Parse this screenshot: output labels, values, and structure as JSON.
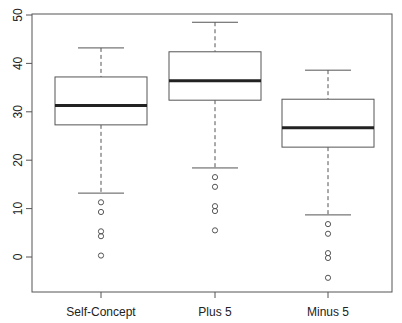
{
  "chart_data": {
    "type": "boxplot",
    "title": "",
    "xlabel": "",
    "ylabel": "",
    "ylim": [
      -6,
      50
    ],
    "yticks": [
      0,
      10,
      20,
      30,
      40,
      50
    ],
    "grid": false,
    "legend": null,
    "categories": [
      "Self-Concept",
      "Plus 5",
      "Minus 5"
    ],
    "series": [
      {
        "name": "Self-Concept",
        "whisker_high": 43.2,
        "q3": 37.2,
        "median": 31.3,
        "q1": 27.3,
        "whisker_low": 13.2,
        "outliers": [
          11.3,
          9.3,
          5.3,
          4.3,
          0.3
        ]
      },
      {
        "name": "Plus 5",
        "whisker_high": 48.5,
        "q3": 42.4,
        "median": 36.4,
        "q1": 32.4,
        "whisker_low": 18.4,
        "outliers": [
          16.5,
          14.5,
          10.5,
          9.5,
          5.5
        ]
      },
      {
        "name": "Minus 5",
        "whisker_high": 38.6,
        "q3": 32.6,
        "median": 26.7,
        "q1": 22.7,
        "whisker_low": 8.7,
        "outliers": [
          6.8,
          4.8,
          0.8,
          -0.2,
          -4.3
        ]
      }
    ]
  }
}
